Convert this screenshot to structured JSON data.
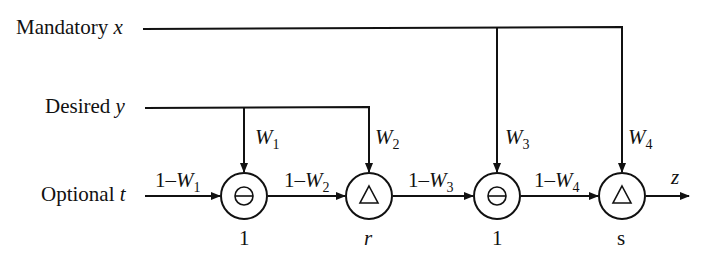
{
  "diagram": {
    "inputs": [
      {
        "id": "mandatory",
        "label": "Mandatory",
        "var": "x"
      },
      {
        "id": "desired",
        "label": "Desired",
        "var": "y"
      },
      {
        "id": "optional",
        "label": "Optional",
        "var": "t"
      }
    ],
    "weights": {
      "w1": {
        "letter": "W",
        "sub": "1"
      },
      "w2": {
        "letter": "W",
        "sub": "2"
      },
      "w3": {
        "letter": "W",
        "sub": "3"
      },
      "w4": {
        "letter": "W",
        "sub": "4"
      }
    },
    "complements": {
      "c1": {
        "prefix": "1–",
        "letter": "W",
        "sub": "1"
      },
      "c2": {
        "prefix": "1–",
        "letter": "W",
        "sub": "2"
      },
      "c3": {
        "prefix": "1–",
        "letter": "W",
        "sub": "3"
      },
      "c4": {
        "prefix": "1–",
        "letter": "W",
        "sub": "4"
      }
    },
    "nodes": [
      {
        "id": "n1",
        "operator": "minus-circle",
        "param": "1"
      },
      {
        "id": "n2",
        "operator": "triangle",
        "param": "r"
      },
      {
        "id": "n3",
        "operator": "minus-circle",
        "param": "1"
      },
      {
        "id": "n4",
        "operator": "triangle",
        "param": "s"
      }
    ],
    "output": {
      "var": "z"
    },
    "colors": {
      "stroke": "#111111",
      "background": "#ffffff"
    }
  }
}
